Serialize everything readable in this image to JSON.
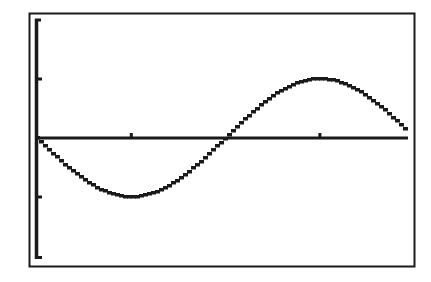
{
  "screen": {
    "type": "graphing-calculator-screen",
    "frame_color": "#1a1a1a",
    "background": "#ffffff",
    "ink_color": "#1a1a1a"
  },
  "chart_data": {
    "type": "line",
    "title": "",
    "xlabel": "",
    "ylabel": "",
    "function": "y = -sin(x)",
    "xlim": [
      0,
      6.18
    ],
    "ylim": [
      -2,
      2
    ],
    "x_ticks": [
      1.5708,
      4.7124
    ],
    "y_ticks": [
      -1,
      1
    ],
    "grid": false,
    "legend": "none",
    "series": [
      {
        "name": "Y1",
        "x": [
          0,
          0.7854,
          1.5708,
          2.3562,
          3.1416,
          3.927,
          4.7124,
          5.4978,
          6.18
        ],
        "values": [
          0,
          -0.707,
          -1,
          -0.707,
          0,
          0.707,
          1,
          0.707,
          0.103
        ]
      }
    ]
  }
}
